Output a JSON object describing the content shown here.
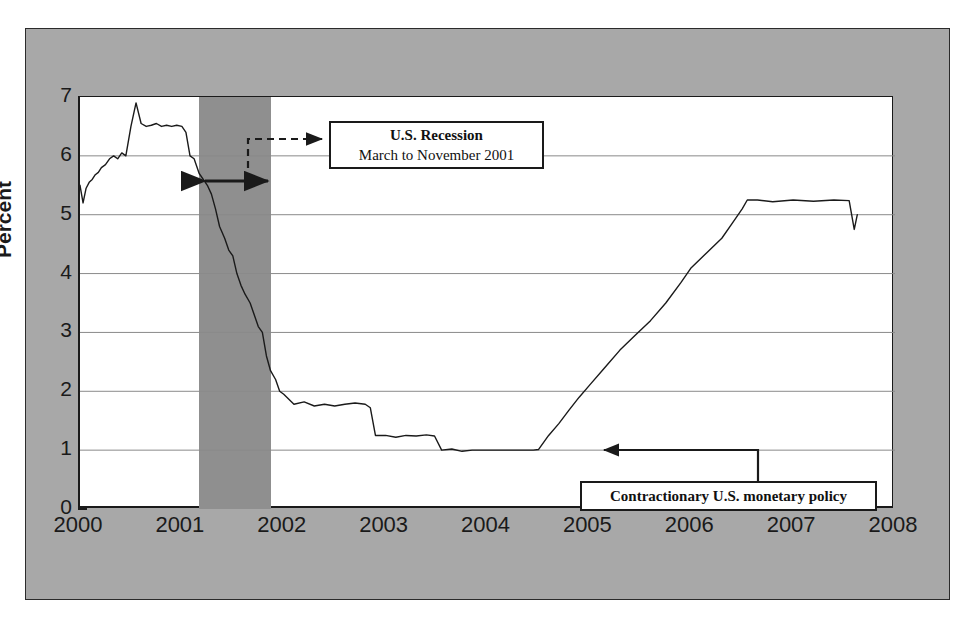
{
  "chart_data": {
    "type": "line",
    "title": "",
    "xlabel": "",
    "ylabel": "Percent",
    "xlim": [
      2000.0,
      2008.0
    ],
    "ylim": [
      0,
      7
    ],
    "grid": true,
    "legend": "none",
    "x_ticks": [
      "2000",
      "2001",
      "2002",
      "2003",
      "2004",
      "2005",
      "2006",
      "2007",
      "2008"
    ],
    "y_ticks": [
      "0",
      "1",
      "2",
      "3",
      "4",
      "5",
      "6",
      "7"
    ],
    "series": [
      {
        "name": "Federal funds rate",
        "color": "#1a1a1a",
        "x": [
          2000.0,
          2000.03,
          2000.06,
          2000.09,
          2000.12,
          2000.15,
          2000.18,
          2000.21,
          2000.25,
          2000.29,
          2000.33,
          2000.37,
          2000.41,
          2000.45,
          2000.5,
          2000.55,
          2000.6,
          2000.65,
          2000.7,
          2000.75,
          2000.8,
          2000.85,
          2000.9,
          2000.95,
          2001.0,
          2001.04,
          2001.08,
          2001.12,
          2001.17,
          2001.21,
          2001.25,
          2001.29,
          2001.33,
          2001.37,
          2001.42,
          2001.46,
          2001.5,
          2001.54,
          2001.58,
          2001.62,
          2001.67,
          2001.71,
          2001.75,
          2001.79,
          2001.83,
          2001.87,
          2001.92,
          2001.96,
          2002.0,
          2002.1,
          2002.2,
          2002.3,
          2002.4,
          2002.5,
          2002.6,
          2002.7,
          2002.8,
          2002.85,
          2002.9,
          2003.0,
          2003.1,
          2003.2,
          2003.3,
          2003.4,
          2003.48,
          2003.55,
          2003.65,
          2003.75,
          2003.85,
          2004.0,
          2004.15,
          2004.3,
          2004.45,
          2004.5,
          2004.6,
          2004.7,
          2004.8,
          2004.9,
          2005.0,
          2005.15,
          2005.3,
          2005.45,
          2005.6,
          2005.75,
          2005.9,
          2006.0,
          2006.15,
          2006.3,
          2006.4,
          2006.5,
          2006.55,
          2006.65,
          2006.8,
          2007.0,
          2007.2,
          2007.4,
          2007.55,
          2007.6,
          2007.63
        ],
        "y": [
          5.5,
          5.2,
          5.45,
          5.55,
          5.6,
          5.68,
          5.72,
          5.8,
          5.85,
          5.95,
          6.0,
          5.95,
          6.05,
          6.0,
          6.5,
          6.9,
          6.55,
          6.5,
          6.52,
          6.55,
          6.5,
          6.52,
          6.5,
          6.52,
          6.5,
          6.4,
          6.0,
          5.95,
          5.7,
          5.6,
          5.5,
          5.35,
          5.1,
          4.8,
          4.6,
          4.4,
          4.3,
          4.0,
          3.8,
          3.65,
          3.5,
          3.3,
          3.1,
          3.0,
          2.6,
          2.35,
          2.2,
          2.0,
          1.95,
          1.78,
          1.82,
          1.75,
          1.78,
          1.75,
          1.78,
          1.8,
          1.78,
          1.72,
          1.25,
          1.25,
          1.22,
          1.25,
          1.24,
          1.26,
          1.24,
          1.0,
          1.02,
          0.98,
          1.0,
          1.0,
          1.0,
          1.0,
          1.0,
          1.01,
          1.25,
          1.45,
          1.68,
          1.9,
          2.1,
          2.4,
          2.7,
          2.95,
          3.2,
          3.5,
          3.85,
          4.1,
          4.35,
          4.6,
          4.85,
          5.1,
          5.25,
          5.25,
          5.22,
          5.25,
          5.23,
          5.25,
          5.24,
          4.75,
          5.0
        ]
      }
    ],
    "shaded_regions": [
      {
        "name": "us-recession-2001",
        "label": "U.S. Recession",
        "start": 2001.17,
        "end": 2001.87,
        "color": "#8f8f8f"
      }
    ],
    "annotations": [
      {
        "name": "recession-callout",
        "line1": "U.S. Recession",
        "line2": "March to November 2001"
      },
      {
        "name": "policy-callout",
        "text": "Contractionary U.S. monetary policy"
      }
    ]
  },
  "colors": {
    "frame_gray": "#a8a8a8",
    "recession_gray": "#8f8f8f",
    "line": "#1a1a1a",
    "grid": "#8a8a8a",
    "plot_bg": "#ffffff"
  }
}
